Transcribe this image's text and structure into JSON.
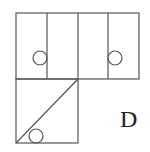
{
  "figure": {
    "type": "cube-net-option",
    "label": "D",
    "stroke_color": "#555555",
    "top_row": {
      "x": 16,
      "y": 13,
      "width": 123,
      "height": 66,
      "dividers_x": [
        47,
        78,
        108
      ]
    },
    "bottom_square": {
      "x": 16,
      "y": 79,
      "width": 62,
      "height": 64,
      "diagonal": {
        "from": [
          16,
          143
        ],
        "to": [
          78,
          79
        ]
      }
    },
    "circles": [
      {
        "cx": 40,
        "cy": 58,
        "r": 7
      },
      {
        "cx": 115,
        "cy": 58,
        "r": 7
      },
      {
        "cx": 36,
        "cy": 136,
        "r": 7
      }
    ]
  }
}
